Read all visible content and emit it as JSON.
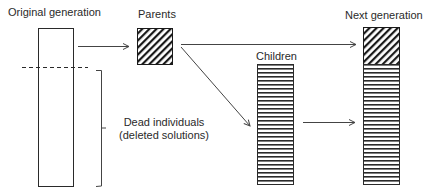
{
  "diagram": {
    "labels": {
      "original_generation": "Original generation",
      "parents": "Parents",
      "children": "Children",
      "next_generation": "Next generation",
      "dead_line1": "Dead individuals",
      "dead_line2": "(deleted solutions)"
    },
    "colors": {
      "stroke": "#2a2a2a",
      "hatch": "#1a1a1a",
      "background": "#ffffff"
    }
  }
}
